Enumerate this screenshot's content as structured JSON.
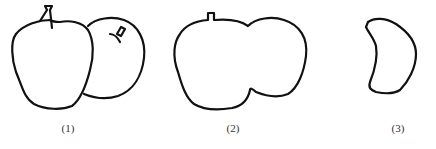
{
  "figures": [
    {
      "id": 1,
      "label": "(1)",
      "description": "two overlapping apples"
    },
    {
      "id": 2,
      "label": "(2)",
      "description": "combined outline of two apples"
    },
    {
      "id": 3,
      "label": "(3)",
      "description": "crescent-shaped remainder"
    }
  ],
  "colors": {
    "stroke": "#111111",
    "background": "#ffffff"
  }
}
